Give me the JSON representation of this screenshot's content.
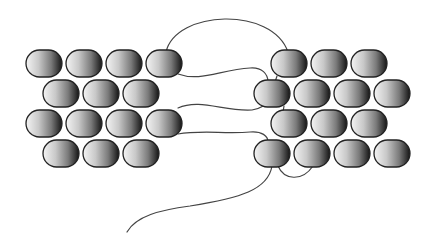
{
  "diagram": {
    "title": "",
    "bead": {
      "width": 36,
      "height": 27,
      "corner_radius": 13.5,
      "gradient": [
        "#f4f4f4",
        "#c8c8c8",
        "#8a8a8a",
        "#1a1a1a"
      ],
      "outline": "#222222"
    },
    "thread_color": "#444444",
    "left_panel": {
      "rows": [
        {
          "y": 50,
          "x": [
            26,
            66,
            106,
            146
          ]
        },
        {
          "y": 80,
          "x": [
            43,
            83,
            123
          ]
        },
        {
          "y": 110,
          "x": [
            26,
            66,
            106,
            146
          ]
        },
        {
          "y": 140,
          "x": [
            43,
            83,
            123
          ]
        }
      ]
    },
    "right_panel": {
      "rows": [
        {
          "y": 50,
          "x": [
            271,
            311,
            351
          ]
        },
        {
          "y": 80,
          "x": [
            254,
            294,
            334,
            374
          ]
        },
        {
          "y": 110,
          "x": [
            271,
            311,
            351
          ]
        },
        {
          "y": 140,
          "x": [
            254,
            294,
            334,
            374
          ]
        }
      ]
    },
    "threads": [
      {
        "name": "top-arch",
        "d": "M166 52 C 176 10, 272 6, 288 52"
      },
      {
        "name": "upper-crossing",
        "d": "M178 74 C 200 82, 220 70, 250 68 C 262 67, 268 74, 268 82"
      },
      {
        "name": "middle-crossing",
        "d": "M178 108 C 200 98, 225 112, 252 110 C 262 108, 268 104, 268 100"
      },
      {
        "name": "lower-crossing",
        "d": "M178 134 C 200 130, 225 134, 250 132 C 262 131, 268 136, 268 142"
      },
      {
        "name": "right-link-1",
        "d": "M277 76 L 275 82"
      },
      {
        "name": "right-link-2",
        "d": "M284 106 L 283 112"
      },
      {
        "name": "bottom-loop",
        "d": "M278 166 C 284 180, 302 182, 313 166"
      },
      {
        "name": "tail",
        "d": "M272 166 C 268 190, 240 198, 190 206 C 160 210, 136 216, 127 232"
      }
    ]
  }
}
